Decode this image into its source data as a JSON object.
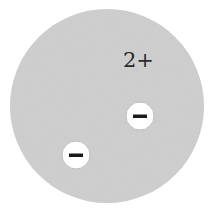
{
  "diagram": {
    "title": "",
    "ion": {
      "charge_label": "2+",
      "fill_color": "#cfcfcf",
      "center": [
        107,
        106
      ],
      "radius": 97
    },
    "electrons": [
      {
        "label": "−",
        "center": [
          140,
          116
        ],
        "radius": 14,
        "fill_color": "#ffffff"
      },
      {
        "label": "−",
        "center": [
          76,
          155
        ],
        "radius": 14,
        "fill_color": "#ffffff"
      }
    ]
  }
}
